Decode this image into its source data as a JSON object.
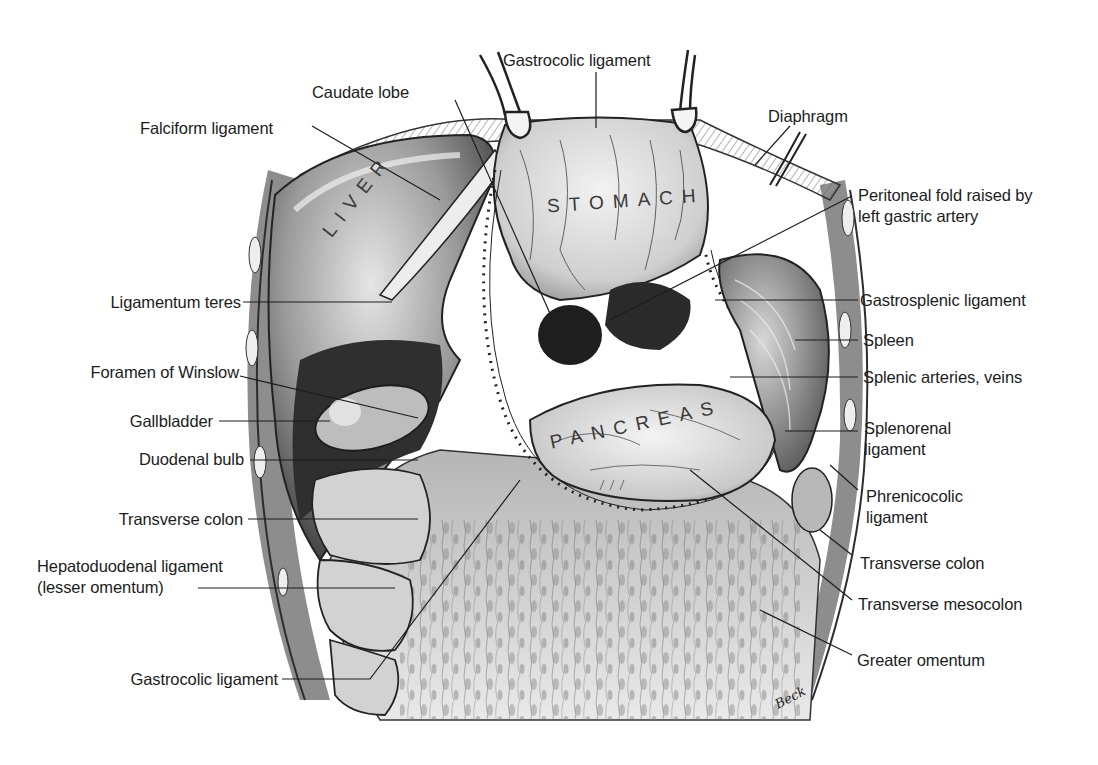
{
  "figure": {
    "type": "anatomical-illustration",
    "organ_labels": {
      "liver": "LIVER",
      "stomach": "STOMACH",
      "pancreas": "PANCREAS"
    },
    "signature": "Beck",
    "colors": {
      "background": "#ffffff",
      "ink": "#1c1c1c",
      "shade_dark": "#3b3b3b",
      "shade_mid": "#8a8a8a",
      "shade_light": "#d9d9d9"
    }
  },
  "labels": {
    "top": [
      {
        "id": "gastrocolic-top",
        "text": "Gastrocolic ligament"
      },
      {
        "id": "caudate-lobe",
        "text": "Caudate lobe"
      },
      {
        "id": "falciform-ligament",
        "text": "Falciform ligament"
      },
      {
        "id": "diaphragm",
        "text": "Diaphragm"
      }
    ],
    "left": [
      {
        "id": "ligamentum-teres",
        "text": "Ligamentum teres"
      },
      {
        "id": "foramen-of-winslow",
        "text": "Foramen of Winslow"
      },
      {
        "id": "gallbladder",
        "text": "Gallbladder"
      },
      {
        "id": "duodenal-bulb",
        "text": "Duodenal bulb"
      },
      {
        "id": "transverse-colon-left",
        "text": "Transverse colon"
      },
      {
        "id": "hepatoduodenal-ligament",
        "text": "Hepatoduodenal ligament",
        "text2": "(lesser omentum)"
      },
      {
        "id": "gastrocolic-bottom",
        "text": "Gastrocolic ligament"
      }
    ],
    "right": [
      {
        "id": "peritoneal-fold",
        "text": "Peritoneal fold raised by",
        "text2": "left gastric artery"
      },
      {
        "id": "gastrosplenic-ligament",
        "text": "Gastrosplenic ligament"
      },
      {
        "id": "spleen",
        "text": "Spleen"
      },
      {
        "id": "splenic-vessels",
        "text": "Splenic arteries, veins"
      },
      {
        "id": "splenorenal-ligament",
        "text": "Splenorenal",
        "text2": "ligament"
      },
      {
        "id": "phrenicocolic-ligament",
        "text": "Phrenicocolic",
        "text2": "ligament"
      },
      {
        "id": "transverse-colon-right",
        "text": "Transverse colon"
      },
      {
        "id": "transverse-mesocolon",
        "text": "Transverse mesocolon"
      },
      {
        "id": "greater-omentum",
        "text": "Greater omentum"
      }
    ]
  }
}
